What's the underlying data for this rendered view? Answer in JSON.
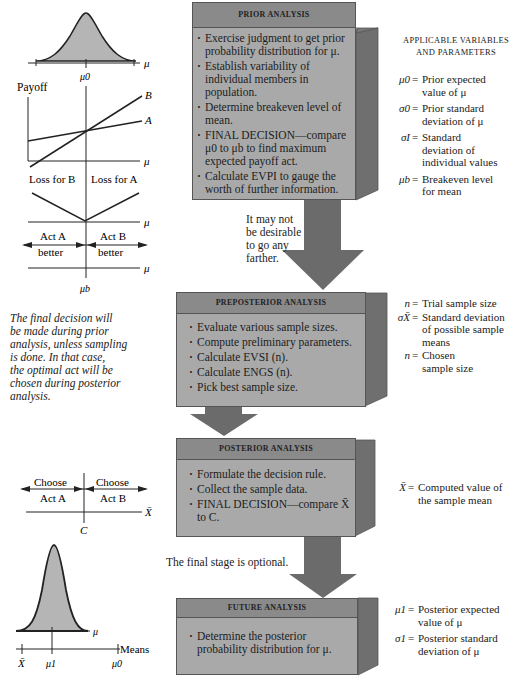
{
  "stages": [
    {
      "title": "PRIOR ANALYSIS",
      "bullets": [
        "Exercise judgment to get prior probability distribution for μ.",
        "Establish variability of individual members in population.",
        "Determine breakeven level of mean.",
        "FINAL DECISION—compare μ0 to μb to find maximum expected payoff act.",
        "Calculate EVPI to gauge the worth of further information."
      ]
    },
    {
      "title": "PREPOSTERIOR ANALYSIS",
      "bullets": [
        "Evaluate various sample sizes.",
        "Compute preliminary parameters.",
        "Calculate EVSI (n).",
        "Calculate ENGS (n).",
        "Pick best sample size."
      ]
    },
    {
      "title": "POSTERIOR ANALYSIS",
      "bullets": [
        "Formulate the decision rule.",
        "Collect the sample data.",
        "FINAL DECISION—compare X̄ to C."
      ]
    },
    {
      "title": "FUTURE ANALYSIS",
      "bullets": [
        "Determine the posterior probability distribution for μ."
      ]
    }
  ],
  "parameters": {
    "heading_line1": "APPLICABLE VARIABLES",
    "heading_line2": "AND PARAMETERS",
    "prior": [
      {
        "symbol": "μ0",
        "line1": "Prior expected",
        "line2": "value of μ",
        "line3": ""
      },
      {
        "symbol": "σ0",
        "line1": "Prior standard",
        "line2": "deviation of μ",
        "line3": ""
      },
      {
        "symbol": "σI",
        "line1": "Standard",
        "line2": "deviation of",
        "line3": "individual values"
      },
      {
        "symbol": "μb",
        "line1": "Breakeven level",
        "line2": "for mean",
        "line3": ""
      }
    ],
    "preposterior": [
      {
        "symbol": "n",
        "line1": "Trial sample size",
        "line2": "",
        "line3": ""
      },
      {
        "symbol": "σX̄",
        "line1": "Standard deviation",
        "line2": "of possible sample",
        "line3": "means"
      },
      {
        "symbol": "n",
        "line1": "Chosen",
        "line2": "sample size",
        "line3": ""
      }
    ],
    "posterior": [
      {
        "symbol": "X̄",
        "line1": "Computed value of",
        "line2": "the sample mean",
        "line3": ""
      }
    ],
    "future": [
      {
        "symbol": "μ1",
        "line1": "Posterior expected",
        "line2": "value of μ",
        "line3": ""
      },
      {
        "symbol": "σ1",
        "line1": "Posterior standard",
        "line2": "deviation of μ",
        "line3": ""
      }
    ],
    "equals": "="
  },
  "notes": {
    "not_desirable": [
      "It may not",
      "be desirable",
      "to go any",
      "farther."
    ],
    "final_stage_optional": "The final stage is optional.",
    "final_decision": [
      "The final decision will",
      "be made during prior",
      "analysis, unless sampling",
      "is done. In that case,",
      "the optimal act will be",
      "chosen during posterior",
      "analysis."
    ]
  },
  "graphs": {
    "prior_dist": {
      "axis": "μ",
      "tick": "μ0"
    },
    "payoff": {
      "ylabel": "Payoff",
      "line_b": "B",
      "line_a": "A",
      "axis": "μ"
    },
    "loss": {
      "left": "Loss for B",
      "right": "Loss for A",
      "axis": "μ"
    },
    "better": {
      "left_top": "Act A",
      "left_bottom": "better",
      "right_top": "Act B",
      "right_bottom": "better",
      "axis": "μ",
      "tick": "μb"
    },
    "decision_rule": {
      "left_top": "Choose",
      "left_bottom": "Act A",
      "right_top": "Choose",
      "right_bottom": "Act B",
      "axis": "X̄",
      "tick": "C"
    },
    "posterior_dist": {
      "axis": "μ",
      "means_label": "Means",
      "tick_xbar": "X̄",
      "tick_mu1": "μ1",
      "tick_mu0": "μ0"
    }
  },
  "colors": {
    "box_front": "#a9a9a9",
    "box_top": "#8a8a8a",
    "box_side": "#6f6f6f",
    "arrow": "#6b6b6b",
    "curve_fill": "#b5b5b5"
  }
}
